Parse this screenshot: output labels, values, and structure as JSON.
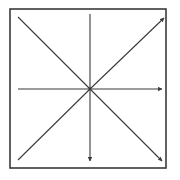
{
  "diagram": {
    "type": "arrow-star",
    "colors": {
      "background": "#ffffff",
      "stroke": "#3a3a3a",
      "frame": "#3a3a3a",
      "bleed_text": "#ececec"
    },
    "frame": {
      "x": 10,
      "y": 9,
      "width": 156,
      "height": 159
    },
    "center": {
      "x": 90,
      "y": 89
    },
    "rays": [
      {
        "name": "up",
        "x2": 90,
        "y2": 14,
        "arrow": false
      },
      {
        "name": "down",
        "x2": 90,
        "y2": 161,
        "arrow": true
      },
      {
        "name": "left",
        "x2": 18,
        "y2": 89,
        "arrow": false
      },
      {
        "name": "right",
        "x2": 162,
        "y2": 89,
        "arrow": true
      },
      {
        "name": "up-left",
        "x2": 18,
        "y2": 17,
        "arrow": false
      },
      {
        "name": "down-right",
        "x2": 162,
        "y2": 161,
        "arrow": true
      },
      {
        "name": "down-left",
        "x2": 18,
        "y2": 160,
        "arrow": false
      },
      {
        "name": "up-right",
        "x2": 164,
        "y2": 18,
        "arrow": true
      }
    ]
  }
}
